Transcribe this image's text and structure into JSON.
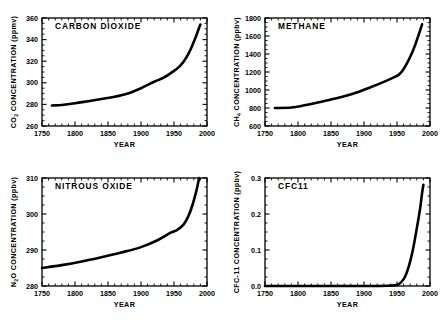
{
  "figure": {
    "background": "#ffffff",
    "line_color": "#000000",
    "panel_count": 4
  },
  "chart_data": [
    {
      "type": "line",
      "title": "CARBON  DIOXIDE",
      "gas": "CO2",
      "xlabel": "YEAR",
      "ylabel": "CO2 CONCENTRATION (ppmv)",
      "ylabel_prefix": "CO",
      "ylabel_subscript": "2",
      "ylabel_suffix": " CONCENTRATION (ppmv)",
      "xlim": [
        1750,
        2000
      ],
      "ylim": [
        260,
        360
      ],
      "xticks": [
        1750,
        1800,
        1850,
        1900,
        1950,
        2000
      ],
      "yticks": [
        260,
        280,
        300,
        320,
        340,
        360
      ],
      "xtick_labels": [
        "1750",
        "1800",
        "1850",
        "1900",
        "1950",
        "2000"
      ],
      "ytick_labels": [
        "260",
        "280",
        "300",
        "320",
        "340",
        "360"
      ],
      "x_minor_step": 10,
      "y_minor_step": 5,
      "grid": false,
      "legend": "none",
      "x": [
        1765,
        1780,
        1800,
        1820,
        1840,
        1860,
        1880,
        1900,
        1920,
        1935,
        1950,
        1958,
        1965,
        1972,
        1978,
        1984,
        1988,
        1990
      ],
      "values": [
        279,
        279.5,
        281,
        283,
        285,
        287,
        290,
        295,
        301,
        305,
        311,
        315,
        320,
        327,
        335,
        344,
        351,
        354
      ]
    },
    {
      "type": "line",
      "title": "METHANE",
      "gas": "CH4",
      "xlabel": "YEAR",
      "ylabel": "CH4 CONCENTRATION (ppbv)",
      "ylabel_prefix": "CH",
      "ylabel_subscript": "4",
      "ylabel_suffix": " CONCENTRATION (ppbv)",
      "xlim": [
        1750,
        2000
      ],
      "ylim": [
        600,
        1800
      ],
      "xticks": [
        1750,
        1800,
        1850,
        1900,
        1950,
        2000
      ],
      "yticks": [
        600,
        800,
        1000,
        1200,
        1400,
        1600,
        1800
      ],
      "xtick_labels": [
        "1750",
        "1800",
        "1850",
        "1900",
        "1950",
        "2000"
      ],
      "ytick_labels": [
        "600",
        "800",
        "1000",
        "1200",
        "1400",
        "1600",
        "1800"
      ],
      "x_minor_step": 10,
      "y_minor_step": 50,
      "grid": false,
      "legend": "none",
      "x": [
        1765,
        1790,
        1810,
        1830,
        1850,
        1870,
        1890,
        1910,
        1930,
        1945,
        1952,
        1958,
        1965,
        1972,
        1978,
        1984,
        1988
      ],
      "values": [
        800,
        805,
        830,
        860,
        895,
        930,
        975,
        1030,
        1090,
        1140,
        1165,
        1210,
        1295,
        1400,
        1510,
        1640,
        1730
      ]
    },
    {
      "type": "line",
      "title": "NITROUS  OXIDE",
      "gas": "N2O",
      "xlabel": "YEAR",
      "ylabel": "N2O CONCENTRATION (ppbv)",
      "ylabel_prefix": "N",
      "ylabel_subscript": "2",
      "ylabel_suffix": "O  CONCENTRATION (ppbv)",
      "xlim": [
        1750,
        2000
      ],
      "ylim": [
        280,
        310
      ],
      "xticks": [
        1750,
        1800,
        1850,
        1900,
        1950,
        2000
      ],
      "yticks": [
        280,
        290,
        300,
        310
      ],
      "xtick_labels": [
        "1750",
        "1800",
        "1850",
        "1900",
        "1950",
        "2000"
      ],
      "ytick_labels": [
        "280",
        "290",
        "300",
        "310"
      ],
      "x_minor_step": 10,
      "y_minor_step": 2.5,
      "grid": false,
      "legend": "none",
      "x": [
        1750,
        1780,
        1810,
        1840,
        1870,
        1900,
        1925,
        1945,
        1955,
        1965,
        1972,
        1978,
        1984,
        1988
      ],
      "values": [
        285,
        285.8,
        286.8,
        288.0,
        289.3,
        290.8,
        292.7,
        294.8,
        295.6,
        297.2,
        299.5,
        302.5,
        306.5,
        310
      ]
    },
    {
      "type": "line",
      "title": "CFC11",
      "gas": "CFC-11",
      "xlabel": "YEAR",
      "ylabel": "CFC-11 CONCENTRATION (ppbv)",
      "ylabel_prefix": "CFC-11",
      "ylabel_subscript": "",
      "ylabel_suffix": "  CONCENTRATION (ppbv)",
      "xlim": [
        1750,
        2000
      ],
      "ylim": [
        0.0,
        0.3
      ],
      "xticks": [
        1750,
        1800,
        1850,
        1900,
        1950,
        2000
      ],
      "yticks": [
        0.0,
        0.1,
        0.2,
        0.3
      ],
      "xtick_labels": [
        "1750",
        "1800",
        "1850",
        "1900",
        "1950",
        "2000"
      ],
      "ytick_labels": [
        "0.0",
        "0.1",
        "0.2",
        "0.3"
      ],
      "x_minor_step": 10,
      "y_minor_step": 0.025,
      "grid": false,
      "legend": "none",
      "x": [
        1750,
        1900,
        1940,
        1950,
        1956,
        1962,
        1968,
        1974,
        1980,
        1985,
        1988,
        1990
      ],
      "values": [
        0.0,
        0.0,
        0.001,
        0.003,
        0.01,
        0.025,
        0.055,
        0.1,
        0.16,
        0.215,
        0.258,
        0.281
      ]
    }
  ]
}
